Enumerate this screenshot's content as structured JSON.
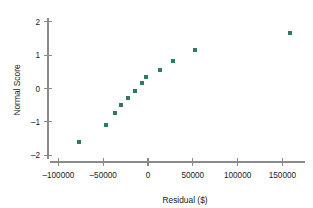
{
  "chart_data": {
    "type": "scatter",
    "title": "",
    "subtitle": "",
    "xlabel": "Residual ($)",
    "ylabel": "Normal Score",
    "xlim": [
      -110000,
      170000
    ],
    "ylim": [
      -2.2,
      2.2
    ],
    "xticks": [
      -100000,
      -50000,
      0,
      50000,
      100000,
      150000
    ],
    "xticklabels": [
      "-100000",
      "-50000",
      "0",
      "50000",
      "100000",
      "150000"
    ],
    "yticks": [
      -2,
      -1,
      0,
      1,
      2
    ],
    "yticklabels": [
      "-2",
      "-1",
      "0",
      "1",
      "2"
    ],
    "grid": false,
    "legend": false,
    "marker": {
      "shape": "square",
      "size": 4,
      "color": "#2f7a5e"
    },
    "series": [
      {
        "name": "Residuals",
        "x": [
          -77000,
          -47000,
          -37000,
          -30000,
          -22000,
          -15000,
          -7000,
          -2000,
          13000,
          28000,
          52000,
          158000
        ],
        "y": [
          -1.62,
          -1.11,
          -0.75,
          -0.49,
          -0.3,
          -0.07,
          0.16,
          0.35,
          0.56,
          0.82,
          1.15,
          1.67
        ],
        "points": [
          {
            "x": -77000,
            "y": -1.62
          },
          {
            "x": -47000,
            "y": -1.11
          },
          {
            "x": -37000,
            "y": -0.75
          },
          {
            "x": -30000,
            "y": -0.49
          },
          {
            "x": -22000,
            "y": -0.3
          },
          {
            "x": -15000,
            "y": -0.07
          },
          {
            "x": -7000,
            "y": 0.16
          },
          {
            "x": -2000,
            "y": 0.35
          },
          {
            "x": 13000,
            "y": 0.56
          },
          {
            "x": 28000,
            "y": 0.82
          },
          {
            "x": 52000,
            "y": 1.15
          },
          {
            "x": 158000,
            "y": 1.67
          }
        ]
      }
    ],
    "colors": {
      "marker": "#2f7a5e",
      "axis": "#8a8a8a",
      "text": "#1a1a1a",
      "background": "#ffffff"
    },
    "geometry": {
      "plot_left": 48,
      "plot_right": 305,
      "plot_top": 18,
      "plot_bottom": 162,
      "x_zero_px": 148,
      "x_px_per_50000": 44.8,
      "y_zero_px": 88.5,
      "y_px_per_unit": 33.3,
      "y_axis_x": 48,
      "x_axis_y": 162
    }
  }
}
